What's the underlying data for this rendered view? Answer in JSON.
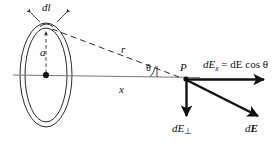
{
  "figure": {
    "type": "physics-vector-diagram",
    "width": 276,
    "height": 151,
    "background": "#ffffff",
    "stroke_color": "#2b2b2b",
    "bold_stroke_color": "#101010",
    "text_color": "#101010"
  },
  "labels": {
    "dl": "dl",
    "a": "a",
    "r": "r",
    "x": "x",
    "theta": "θ",
    "P": "P",
    "equation_lead": "dE",
    "equation_sub": "x",
    "equation_rest": " = dE cos θ",
    "dE_perp_lead": "dE",
    "dE_perp_sub": "⊥",
    "dE_vector_d": "d",
    "dE_vector_E": "E"
  },
  "geometry": {
    "ring_center": {
      "x": 46,
      "y": 75
    },
    "ring_outer_rx": 26,
    "ring_outer_ry": 52,
    "ring_inner_rx": 21,
    "ring_inner_ry": 47,
    "ring_top_point": {
      "x": 46,
      "y": 28
    },
    "point_P": {
      "x": 186,
      "y": 80
    },
    "axis_start": {
      "x": 13,
      "y": 75
    },
    "axis_end": {
      "x": 200,
      "y": 77
    },
    "dashed_r_line": {
      "x1": 50,
      "y1": 30,
      "x2": 184,
      "y2": 79
    },
    "vector_axial_end": {
      "x": 268,
      "y": 80
    },
    "vector_perp_end": {
      "x": 186,
      "y": 120
    },
    "vector_total_end": {
      "x": 262,
      "y": 120
    }
  },
  "icons": {
    "arrowhead": "arrowhead-icon",
    "dl_tick_left": "tick-arrow-left-icon",
    "dl_tick_right": "tick-arrow-right-icon",
    "center_dot": "center-dot-icon",
    "point_dot": "point-dot-icon"
  }
}
